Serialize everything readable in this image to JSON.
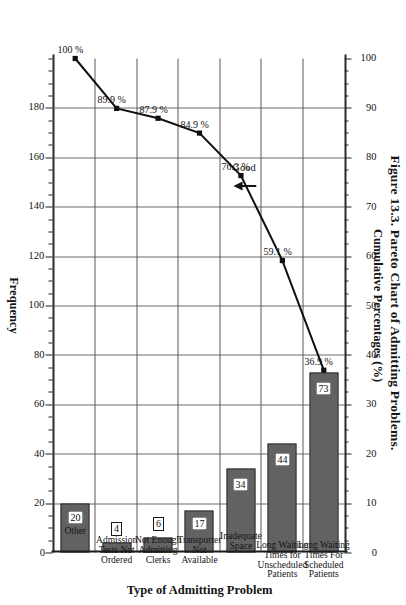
{
  "figure": {
    "caption": "Figure 13.3.  Pareto Chart of Admitting Problems."
  },
  "annotation": {
    "good_label": "Good",
    "arrow_icon": "right-arrow-icon"
  },
  "chart_data": {
    "type": "bar",
    "title": "Figure 13.3.  Pareto Chart of Admitting Problems.",
    "orientation": "vertical (page rotated 90°)",
    "xlabel": "Type of Admitting Problem",
    "ylabel": "Frequency",
    "y2label": "Cumulative Percentages (%)",
    "ylim": [
      0,
      200
    ],
    "y2lim": [
      0,
      100
    ],
    "grid": true,
    "legend": "none",
    "categories": [
      "Long Waiting Times For Scheduled Patients",
      "Long Waiting Times for Unscheduled Patients",
      "Inadequate Space",
      "Transporter Not Available",
      "Not Enough Admitting Clerks",
      "Admission Tests Not Ordered",
      "Other"
    ],
    "category_label_lines": [
      [
        "Long Waiting",
        "Times For",
        "Scheduled",
        "Patients"
      ],
      [
        "Long Waiting",
        "Times for",
        "Unscheduled",
        "Patients"
      ],
      [
        "Inadequate",
        "Space"
      ],
      [
        "Transporter",
        "Not",
        "Available"
      ],
      [
        "Not Enough",
        "Admitting",
        "Clerks"
      ],
      [
        "Admission",
        "Tests Not",
        "Ordered"
      ],
      [
        "Other"
      ]
    ],
    "values": [
      73,
      44,
      34,
      17,
      6,
      4,
      20
    ],
    "bar_value_labels": [
      "73",
      "44",
      "34",
      "17",
      "6",
      "4",
      "20"
    ],
    "cumulative_percentages": [
      36.9,
      59.1,
      76.3,
      84.9,
      87.9,
      89.9,
      100.0
    ],
    "cumulative_labels": [
      "36.9 %",
      "59.1 %",
      "76.3 %",
      "84.9 %",
      "87.9 %",
      "89.9 %",
      "100 %"
    ],
    "frequency_ticks": [
      "0",
      "20",
      "40",
      "60",
      "80",
      "100",
      "120",
      "140",
      "160",
      "180"
    ],
    "frequency_tick_values": [
      0,
      20,
      40,
      60,
      80,
      100,
      120,
      140,
      160,
      180
    ],
    "cumulative_ticks": [
      "0",
      "10",
      "20",
      "30",
      "40",
      "50",
      "60",
      "70",
      "80",
      "90",
      "100"
    ],
    "cumulative_tick_values": [
      0,
      10,
      20,
      30,
      40,
      50,
      60,
      70,
      80,
      90,
      100
    ],
    "total_frequency": 198,
    "colors": {
      "bar_fill": "#a9a9a9",
      "bar_border": "#111111",
      "line": "#101010",
      "grid": "#6d6d6d",
      "axis": "#202020",
      "text": "#141414",
      "background": "#ffffff"
    }
  }
}
